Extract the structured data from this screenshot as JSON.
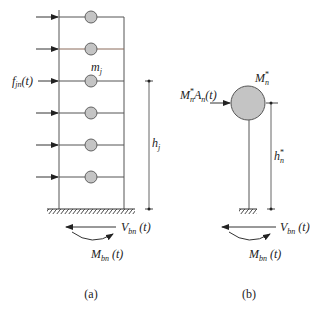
{
  "diagram": {
    "panel_a": {
      "caption": "(a)",
      "force_label": "f",
      "force_sub": "jn",
      "force_arg": "(t)",
      "mass_label": "m",
      "mass_sub": "j",
      "height_label": "h",
      "height_sub": "j",
      "shear_label": "V",
      "shear_sub": "bn",
      "shear_arg": " (t)",
      "moment_label": "M",
      "moment_sub": "bn",
      "moment_arg": " (t)",
      "floors": 6
    },
    "panel_b": {
      "caption": "(b)",
      "force_label_m": "M",
      "force_label_m_sup": "*",
      "force_label_m_sub": "n",
      "force_label_a": "A",
      "force_label_a_sub": "n",
      "force_arg": "(t)",
      "mass_label": "M",
      "mass_sup": "*",
      "mass_sub": "n",
      "height_label": "h",
      "height_sup": "*",
      "height_sub": "n",
      "shear_label": "V",
      "shear_sub": "bn",
      "shear_arg": " (t)",
      "moment_label": "M",
      "moment_sub": "bn",
      "moment_arg": " (t)"
    },
    "colors": {
      "line": "#555555",
      "mass_fill": "#c4c4c4",
      "accent_floor_line": "#8a6a5a"
    }
  }
}
